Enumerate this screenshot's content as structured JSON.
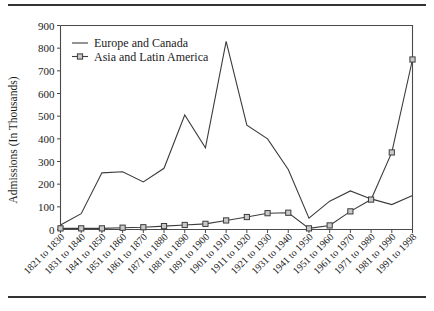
{
  "figure": {
    "rules": {
      "top_rule": "horizontal-rule",
      "bottom_rule": "horizontal-rule"
    }
  },
  "chart_data": {
    "type": "line",
    "title": "",
    "xlabel": "",
    "ylabel": "Admissions (In Thousands)",
    "ylim": [
      0,
      900
    ],
    "ytick_values": [
      0,
      100,
      200,
      300,
      400,
      500,
      600,
      700,
      800,
      900
    ],
    "ytick_labels": [
      "0",
      "100",
      "200",
      "300",
      "400",
      "500",
      "600",
      "700",
      "800",
      "900"
    ],
    "grid": false,
    "legend_position": "top-left",
    "categories": [
      "1821 to 1830",
      "1831 to 1840",
      "1841 to 1850",
      "1851 to 1860",
      "1861 to 1870",
      "1871 to 1880",
      "1881 to 1890",
      "1891 to 1900",
      "1901 to 1910",
      "1911 to 1920",
      "1921 to 1930",
      "1931 to 1940",
      "1941 to 1950",
      "1951 to 1960",
      "1961 to 1970",
      "1971 to 1980",
      "1981 to 1990",
      "1991 to 1998"
    ],
    "series": [
      {
        "name": "Europe and Canada",
        "values": [
          20,
          70,
          250,
          255,
          210,
          270,
          505,
          360,
          830,
          460,
          400,
          265,
          50,
          125,
          170,
          135,
          110,
          150
        ],
        "color": "#3c3c3c",
        "marker": "none"
      },
      {
        "name": "Asia and Latin America",
        "values": [
          5,
          5,
          5,
          8,
          10,
          15,
          20,
          25,
          40,
          55,
          72,
          74,
          5,
          18,
          80,
          132,
          340,
          750
        ],
        "color": "#3c3c3c",
        "marker": "square"
      }
    ],
    "legend": [
      {
        "label": "Europe and Canada",
        "marker": "none"
      },
      {
        "label": "Asia and Latin America",
        "marker": "square"
      }
    ]
  }
}
